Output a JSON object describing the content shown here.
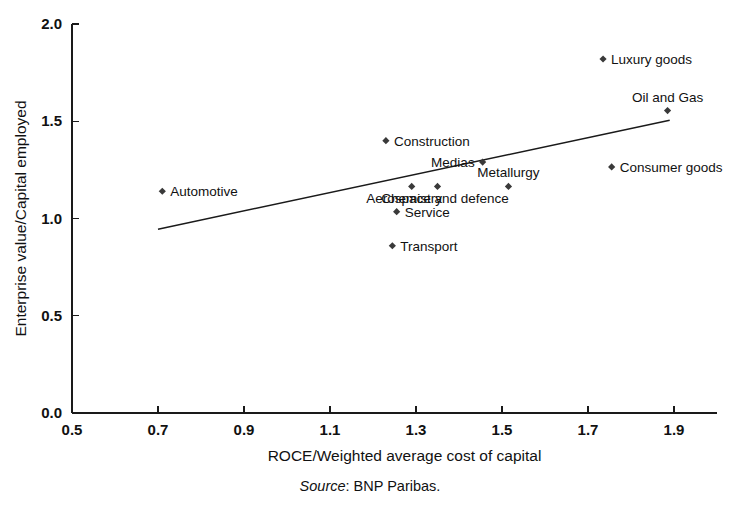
{
  "chart_data": {
    "type": "scatter",
    "title": "",
    "xlabel": "ROCE/Weighted average cost of capital",
    "ylabel": "Enterprise value/Capital employed",
    "xlim": [
      0.5,
      2.0
    ],
    "ylim": [
      0.0,
      2.0
    ],
    "xticks": [
      "0.5",
      "0.7",
      "0.9",
      "1.1",
      "1.3",
      "1.5",
      "1.7",
      "1.9"
    ],
    "xtick_values": [
      0.5,
      0.7,
      0.9,
      1.1,
      1.3,
      1.5,
      1.7,
      1.9
    ],
    "yticks": [
      "0.0",
      "0.5",
      "1.0",
      "1.5",
      "2.0"
    ],
    "ytick_values": [
      0.0,
      0.5,
      1.0,
      1.5,
      2.0
    ],
    "grid": false,
    "legend": "none",
    "points": [
      {
        "label": "Automotive",
        "x": 0.71,
        "y": 1.14,
        "label_pos": "right"
      },
      {
        "label": "Construction",
        "x": 1.23,
        "y": 1.4,
        "label_pos": "right"
      },
      {
        "label": "Chemistry",
        "x": 1.29,
        "y": 1.165,
        "label_pos": "below"
      },
      {
        "label": "Aerospace and defence",
        "x": 1.35,
        "y": 1.165,
        "label_pos": "below"
      },
      {
        "label": "Service",
        "x": 1.255,
        "y": 1.035,
        "label_pos": "right"
      },
      {
        "label": "Transport",
        "x": 1.245,
        "y": 0.86,
        "label_pos": "right"
      },
      {
        "label": "Medias",
        "x": 1.455,
        "y": 1.29,
        "label_pos": "left"
      },
      {
        "label": "Metallurgy",
        "x": 1.515,
        "y": 1.165,
        "label_pos": "above"
      },
      {
        "label": "Luxury goods",
        "x": 1.735,
        "y": 1.82,
        "label_pos": "right"
      },
      {
        "label": "Oil and Gas",
        "x": 1.885,
        "y": 1.555,
        "label_pos": "above"
      },
      {
        "label": "Consumer goods",
        "x": 1.755,
        "y": 1.265,
        "label_pos": "right"
      }
    ],
    "trend_line": {
      "name": "Linear trend",
      "start": {
        "x": 0.7,
        "y": 0.945
      },
      "end": {
        "x": 1.89,
        "y": 1.505
      }
    }
  },
  "source": {
    "prefix": "Source",
    "separator": ": ",
    "text": "BNP Paribas."
  },
  "colors": {
    "axis": "#1a1a1a",
    "marker": "#3a3a3a",
    "text": "#111111",
    "background": "#ffffff"
  }
}
